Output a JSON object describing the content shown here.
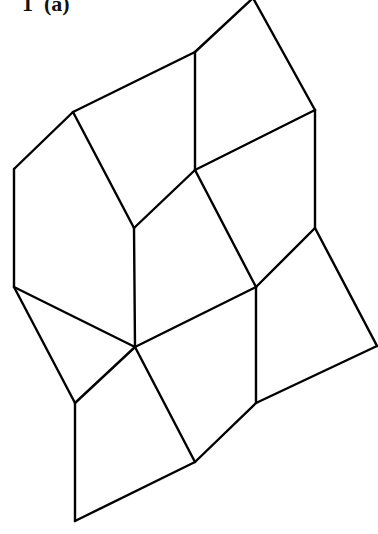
{
  "figure": {
    "label": "1  (a)",
    "stroke_color": "#000000",
    "background": "#ffffff"
  },
  "diagram": {
    "type": "quadrilateral-tiling",
    "vertices": {
      "A": [
        253,
        -2
      ],
      "B": [
        195,
        52
      ],
      "C": [
        73,
        112
      ],
      "D": [
        14,
        169
      ],
      "E": [
        315,
        110
      ],
      "F": [
        195,
        170
      ],
      "G": [
        134,
        228
      ],
      "H": [
        315,
        228
      ],
      "I": [
        14,
        287
      ],
      "J": [
        135,
        347
      ],
      "K": [
        256,
        287
      ],
      "L": [
        377,
        346
      ],
      "M": [
        75,
        403
      ],
      "N": [
        256,
        403
      ],
      "O": [
        195,
        462
      ],
      "P": [
        75,
        521
      ]
    },
    "edges": [
      [
        "A",
        "B"
      ],
      [
        "B",
        "C"
      ],
      [
        "C",
        "D"
      ],
      [
        "A",
        "E"
      ],
      [
        "B",
        "F"
      ],
      [
        "E",
        "F"
      ],
      [
        "C",
        "G"
      ],
      [
        "F",
        "G"
      ],
      [
        "D",
        "I"
      ],
      [
        "E",
        "H"
      ],
      [
        "F",
        "K"
      ],
      [
        "H",
        "K"
      ],
      [
        "G",
        "J"
      ],
      [
        "I",
        "J"
      ],
      [
        "H",
        "L"
      ],
      [
        "I",
        "M"
      ],
      [
        "J",
        "M"
      ],
      [
        "J",
        "K"
      ],
      [
        "K",
        "N"
      ],
      [
        "L",
        "N"
      ],
      [
        "J",
        "O"
      ],
      [
        "N",
        "O"
      ],
      [
        "M",
        "P"
      ],
      [
        "O",
        "P"
      ]
    ]
  }
}
